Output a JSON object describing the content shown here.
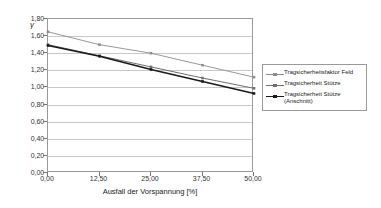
{
  "chart_data": {
    "type": "line",
    "title": "",
    "xlabel": "Ausfall der Vorspannung [%]",
    "ylabel": "γ",
    "x": [
      0,
      12.5,
      25,
      37.5,
      50
    ],
    "xlim": [
      0,
      50
    ],
    "ylim": [
      0,
      1.8
    ],
    "xticks": [
      "0,00",
      "12,50",
      "25,00",
      "37,50",
      "50,00"
    ],
    "yticks": [
      "0,00",
      "0,20",
      "0,40",
      "0,60",
      "0,80",
      "1,00",
      "1,20",
      "1,40",
      "1,60",
      "1,80"
    ],
    "ytick_values": [
      0,
      0.2,
      0.4,
      0.6,
      0.8,
      1.0,
      1.2,
      1.4,
      1.6,
      1.8
    ],
    "grid": "horizontal",
    "legend_position": "right-inside",
    "series": [
      {
        "name": "Tragsicherheitsfaktor Feld",
        "values": [
          1.65,
          1.5,
          1.4,
          1.26,
          1.12
        ],
        "color": "#8c8c8c",
        "marker": "square",
        "width": 0.9
      },
      {
        "name": "Tragsicherheit Stütze",
        "values": [
          1.5,
          1.37,
          1.24,
          1.11,
          0.99
        ],
        "color": "#6e6e6e",
        "marker": "square",
        "width": 1.0
      },
      {
        "name": "Tragsicherheit Stütze\n(Anschnitt)",
        "values": [
          1.49,
          1.365,
          1.21,
          1.07,
          0.93
        ],
        "color": "#1a1a1a",
        "marker": "square",
        "width": 1.6
      }
    ]
  },
  "legend": {
    "items": [
      "Tragsicherheitsfaktor Feld",
      "Tragsicherheit Stütze",
      "Tragsicherheit Stütze\n(Anschnitt)"
    ]
  }
}
